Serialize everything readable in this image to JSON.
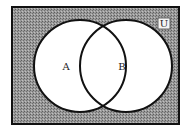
{
  "diagram": {
    "type": "venn",
    "universe_label": "U",
    "sets": [
      {
        "name": "A",
        "label": "A"
      },
      {
        "name": "B",
        "label": "B"
      }
    ],
    "shaded_region": "complement of A union B",
    "colors": {
      "shade": "#8a8a8a",
      "border": "#111111",
      "circle_fill": "#ffffff"
    }
  }
}
